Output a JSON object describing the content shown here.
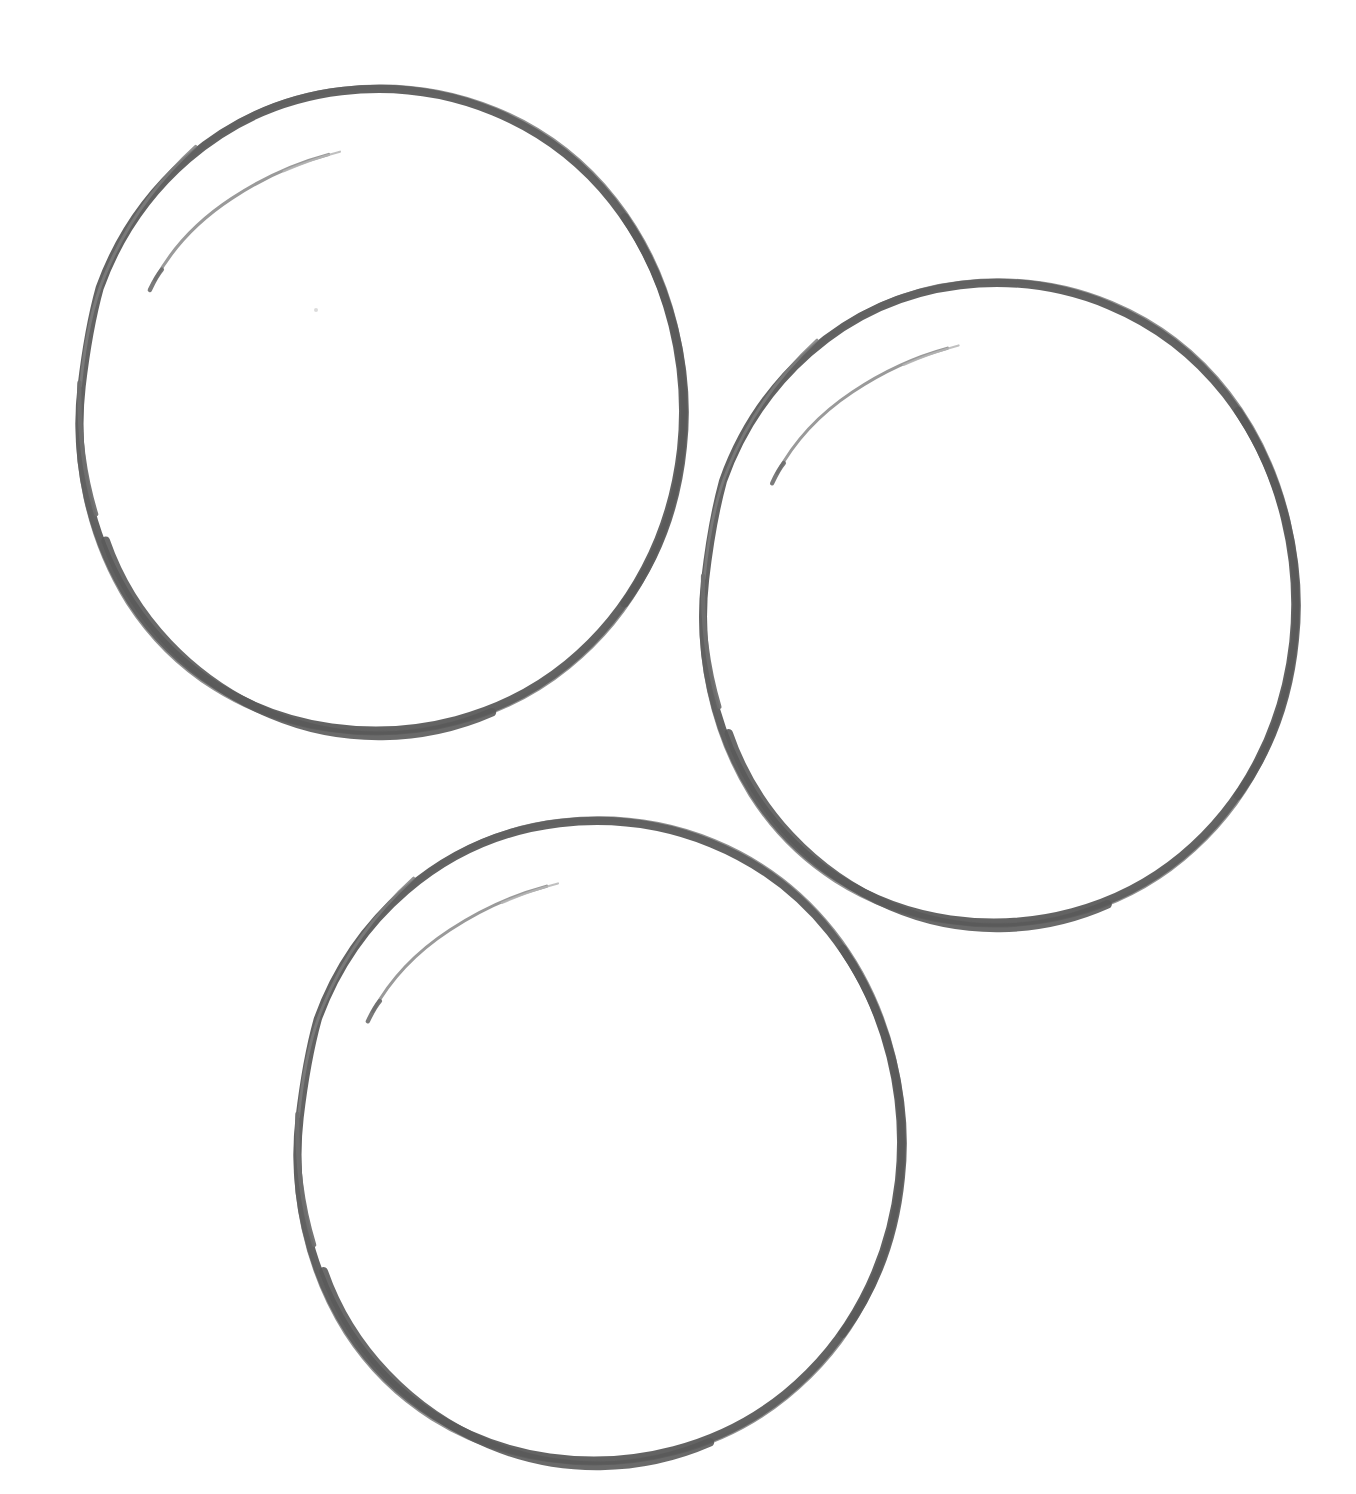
{
  "canvas": {
    "width": 1356,
    "height": 1494,
    "background_color": "#ffffff",
    "title": "Three hand-drawn circles"
  },
  "style": {
    "stroke_color": "#5d5d5d",
    "stroke_color_light": "#8a8a8a",
    "stroke_color_faint": "#b0b0b0",
    "stroke_width_max": 9,
    "stroke_width_min": 2,
    "medium": "pencil-sketch",
    "fill": "none"
  },
  "shapes": [
    {
      "name": "circle-top-left",
      "label": "Circle 1",
      "center_x": 374,
      "center_y": 395,
      "radius_x": 316,
      "radius_y": 321,
      "bounds": {
        "left": 58,
        "top": 74,
        "right": 690,
        "bottom": 716
      },
      "rotation_deg": -4,
      "has_overshoot_tail": true,
      "tail_position": "upper-left"
    },
    {
      "name": "circle-right",
      "label": "Circle 2",
      "center_x": 992,
      "center_y": 588,
      "radius_x": 310,
      "radius_y": 320,
      "bounds": {
        "left": 682,
        "top": 268,
        "right": 1302,
        "bottom": 908
      },
      "rotation_deg": -4,
      "has_overshoot_tail": true,
      "tail_position": "upper-left"
    },
    {
      "name": "circle-bottom",
      "label": "Circle 3",
      "center_x": 592,
      "center_y": 1126,
      "radius_x": 316,
      "radius_y": 320,
      "bounds": {
        "left": 276,
        "top": 806,
        "right": 908,
        "bottom": 1446
      },
      "rotation_deg": -4,
      "has_overshoot_tail": true,
      "tail_position": "upper-left"
    }
  ],
  "marks": [
    {
      "name": "stray-speck",
      "x": 316,
      "y": 310,
      "size": 4,
      "color": "#cfcfcf"
    }
  ]
}
